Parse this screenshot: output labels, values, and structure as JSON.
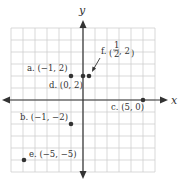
{
  "diagram": {
    "type": "coordinate-plane",
    "axes": {
      "x_label": "x",
      "y_label": "y"
    },
    "grid": {
      "min": -6,
      "max": 6,
      "step": 1
    },
    "colors": {
      "grid": "#c8c8c8",
      "axis": "#333333",
      "point": "#333333"
    },
    "points": [
      {
        "id": "a",
        "label": "a. (−1, 2)",
        "x": -1,
        "y": 2
      },
      {
        "id": "b",
        "label": "b. (−1, −2)",
        "x": -1,
        "y": -2
      },
      {
        "id": "c",
        "label": "c. (5, 0)",
        "x": 5,
        "y": 0
      },
      {
        "id": "d",
        "label": "d. (0, 2)",
        "x": 0,
        "y": 2
      },
      {
        "id": "e",
        "label": "e. (−5, −5)",
        "x": -5,
        "y": -5
      },
      {
        "id": "f",
        "label_prefix": "f.",
        "frac_num": "1",
        "frac_den": "2",
        "label_suffix": ", 2",
        "x": 0.5,
        "y": 2
      }
    ]
  }
}
